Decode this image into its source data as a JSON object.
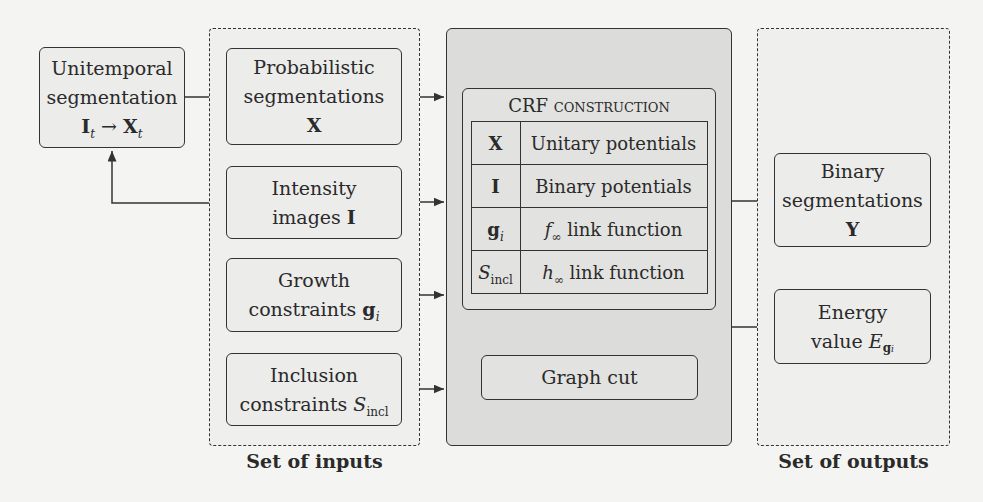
{
  "diagram": {
    "nodes": {
      "unitemporal": {
        "line1": "Unitemporal",
        "line2": "segmentation",
        "formula_left": "I",
        "formula_left_sub": "t",
        "arrow": "→",
        "formula_right": "X",
        "formula_right_sub": "t"
      },
      "inputs": {
        "caption": "Set of inputs",
        "items": [
          {
            "line1": "Probabilistic",
            "line2": "segmentations",
            "symbol": "X"
          },
          {
            "line1": "Intensity",
            "line2": "images",
            "symbol": "I"
          },
          {
            "line1": "Growth",
            "line2": "constraints",
            "symbol": "g",
            "symbol_sub": "i"
          },
          {
            "line1": "Inclusion",
            "line2": "constraints",
            "symbol": "S",
            "symbol_sub": "incl"
          }
        ]
      },
      "crf": {
        "title": "CRF construction",
        "rows": [
          {
            "symbol": "X",
            "desc": "Unitary potentials"
          },
          {
            "symbol": "I",
            "desc": "Binary potentials"
          },
          {
            "symbol": "g",
            "symbol_sub": "i",
            "desc_prefix": "f",
            "desc_prefix_sub": "∞",
            "desc": "link function"
          },
          {
            "symbol": "S",
            "symbol_sub": "incl",
            "desc_prefix": "h",
            "desc_prefix_sub": "∞",
            "desc": "link function"
          }
        ],
        "graph_cut": "Graph cut"
      },
      "outputs": {
        "caption": "Set of outputs",
        "items": [
          {
            "line1": "Binary",
            "line2": "segmentations",
            "symbol": "Y"
          },
          {
            "line1": "Energy",
            "line2": "value",
            "symbol": "E",
            "symbol_sub": "g",
            "symbol_subsub": "i"
          }
        ]
      }
    },
    "colors": {
      "stroke": "#333333",
      "background": "#f4f4f2",
      "crf_fill": "#dcdcda",
      "box_fill": "#ececea"
    }
  }
}
